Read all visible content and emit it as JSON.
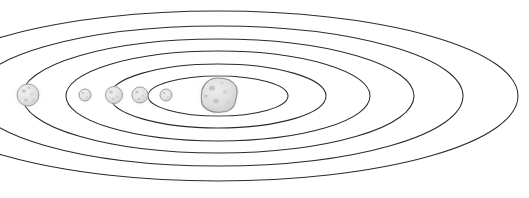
{
  "diagram": {
    "type": "concentric-elliptical-orbits",
    "background_color": "#ffffff",
    "orbit_stroke_color": "#2b2b2b",
    "planet_fill_color": "#e3e3e3",
    "planet_stroke_color": "#9a9a9a",
    "sun_fill_color": "#dcdcdc",
    "glow_color": "#d5d5d5",
    "center": {
      "x": 218,
      "y": 96
    },
    "orbits": [
      {
        "name": "orbit-1-innermost",
        "rx": 70,
        "ry": 20,
        "label": "Orbit 1"
      },
      {
        "name": "orbit-2",
        "rx": 108,
        "ry": 32,
        "label": "Orbit 2"
      },
      {
        "name": "orbit-3",
        "rx": 152,
        "ry": 45,
        "label": "Orbit 3"
      },
      {
        "name": "orbit-4",
        "rx": 196,
        "ry": 57,
        "label": "Orbit 4"
      },
      {
        "name": "orbit-5",
        "rx": 245,
        "ry": 70,
        "label": "Orbit 5"
      },
      {
        "name": "orbit-6-outermost",
        "rx": 300,
        "ry": 85,
        "label": "Orbit 6"
      }
    ],
    "bodies": [
      {
        "name": "central-star",
        "label": "Sun",
        "cx": 218,
        "cy": 95,
        "r": 17,
        "glow_r": 25,
        "type": "star"
      },
      {
        "name": "planet-1",
        "label": "Planet 1",
        "cx": 166,
        "cy": 95,
        "r": 6,
        "glow_r": 9,
        "type": "planet",
        "orbit": "orbit-1-innermost"
      },
      {
        "name": "planet-2",
        "label": "Planet 2",
        "cx": 140,
        "cy": 95,
        "r": 8,
        "glow_r": 12,
        "type": "planet",
        "orbit": "orbit-2"
      },
      {
        "name": "planet-3",
        "label": "Planet 3",
        "cx": 114,
        "cy": 95,
        "r": 8.5,
        "glow_r": 12.5,
        "type": "planet",
        "orbit": "orbit-3"
      },
      {
        "name": "planet-4",
        "label": "Planet 4",
        "cx": 85,
        "cy": 95,
        "r": 6,
        "glow_r": 9.5,
        "type": "planet",
        "orbit": "orbit-4"
      },
      {
        "name": "planet-5",
        "label": "Planet 5",
        "cx": 28,
        "cy": 95,
        "r": 11,
        "glow_r": 16,
        "type": "planet",
        "orbit": "orbit-6-outermost"
      }
    ]
  }
}
